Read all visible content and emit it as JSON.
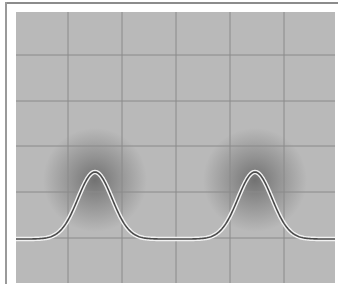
{
  "chart_data": {
    "type": "line",
    "title": "",
    "xlabel": "",
    "ylabel": "",
    "grid": true,
    "legend": null,
    "plot_area_px": {
      "left": 16,
      "top": 12,
      "right": 335,
      "bottom": 283
    },
    "grid_px": {
      "vertical": [
        68,
        122,
        176,
        230,
        284
      ],
      "horizontal": [
        55,
        101,
        146,
        192,
        238
      ]
    },
    "grid_divisions": {
      "x": 6,
      "y": 6
    },
    "baseline_y_px": 239,
    "peaks": [
      {
        "center_x_px": 95,
        "peak_y_px": 172,
        "width_sigma_px": 17
      },
      {
        "center_x_px": 255,
        "peak_y_px": 172,
        "width_sigma_px": 17
      }
    ],
    "x": [
      0,
      0.5,
      1,
      1.5,
      2,
      2.5,
      3,
      3.5,
      4,
      4.5,
      5,
      5.5,
      6
    ],
    "series": [
      {
        "name": "trace",
        "values": [
          0,
          0.02,
          0.35,
          1.0,
          0.35,
          0.02,
          0,
          0.02,
          0.35,
          1.0,
          0.35,
          0.02,
          0
        ]
      }
    ],
    "colors": {
      "background": "#b9b9b9",
      "grid": "#8a8a8a",
      "trace": "#4a4a4a",
      "trace_halo": "#f2f2f2",
      "glow": "#5a5a5a"
    }
  }
}
